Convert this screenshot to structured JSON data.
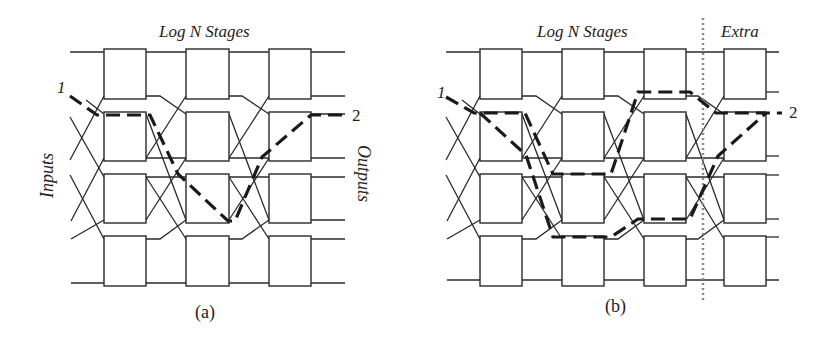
{
  "panel_a": {
    "title": "Log N Stages",
    "caption": "(a)",
    "input_label": "Inputs",
    "output_label": "Outputs",
    "source_label": "1",
    "dest_label": "2",
    "stages": 3
  },
  "panel_b": {
    "title": "Log N Stages",
    "extra_label": "Extra",
    "caption": "(b)",
    "source_label": "1",
    "dest_label": "2",
    "stages": 3,
    "extra_stages": 1
  },
  "colors": {
    "wire": "#2a2a2a",
    "path": "#1a1a1a",
    "extra_divider": "#8a8a8a",
    "background": "#ffffff"
  }
}
